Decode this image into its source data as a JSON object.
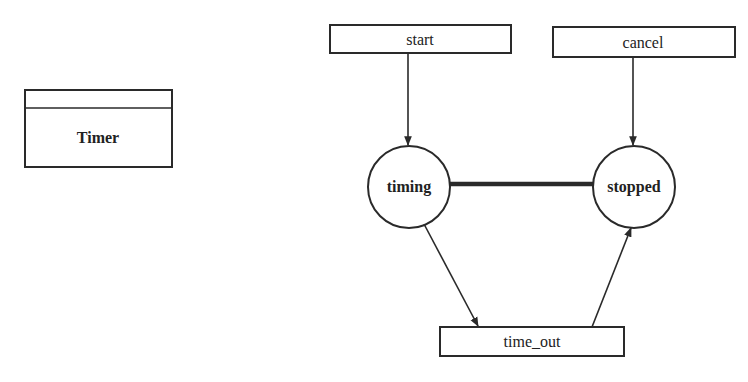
{
  "diagram": {
    "type": "state-transition",
    "object": {
      "name": "Timer"
    },
    "events": [
      {
        "id": "start",
        "label": "start"
      },
      {
        "id": "cancel",
        "label": "cancel"
      },
      {
        "id": "time_out",
        "label": "time_out"
      }
    ],
    "states": [
      {
        "id": "timing",
        "label": "timing"
      },
      {
        "id": "stopped",
        "label": "stopped"
      }
    ],
    "connections": [
      {
        "from": "start",
        "to": "timing",
        "style": "arrow"
      },
      {
        "from": "cancel",
        "to": "stopped",
        "style": "arrow"
      },
      {
        "from": "timing",
        "to": "stopped",
        "style": "thick-line"
      },
      {
        "from": "timing",
        "to": "time_out",
        "style": "arrow"
      },
      {
        "from": "time_out",
        "to": "stopped",
        "style": "arrow"
      }
    ],
    "colors": {
      "stroke": "#2a2a2a",
      "background": "#ffffff",
      "text": "#222222"
    }
  }
}
